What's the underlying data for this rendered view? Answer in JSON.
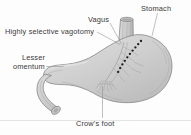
{
  "figure": {
    "title": "Highly selective vagotomy",
    "background_color": "#fdfdfd",
    "label_color": "#3a3a3a",
    "outline_color": "#7b7b7b",
    "organ_fill_color": "#d2d2d2",
    "cut_line_color": "#1c1c1c",
    "leader_color": "#8d8d8d"
  },
  "labels": {
    "highly_selective_vagotomy": "Highly selective vagotomy",
    "vagus": "Vagus",
    "stomach": "Stomach",
    "lesser": "Lesser",
    "omentum": "omentum",
    "crows_foot": "Crow's foot"
  },
  "anatomy": {
    "esophagus": "esophagus",
    "stomach_body": "stomach-body",
    "lesser_curvature": "lesser-curvature",
    "greater_curvature": "greater-curvature",
    "duodenum": "duodenum",
    "pylorus": "pylorus",
    "vagus_nerve_trunk": "vagus-nerve-trunk",
    "nerve_branches": "nerve-branches",
    "crows_foot_branches": "crows-foot-branches",
    "denervation_line": "denervation-dotted-line"
  }
}
